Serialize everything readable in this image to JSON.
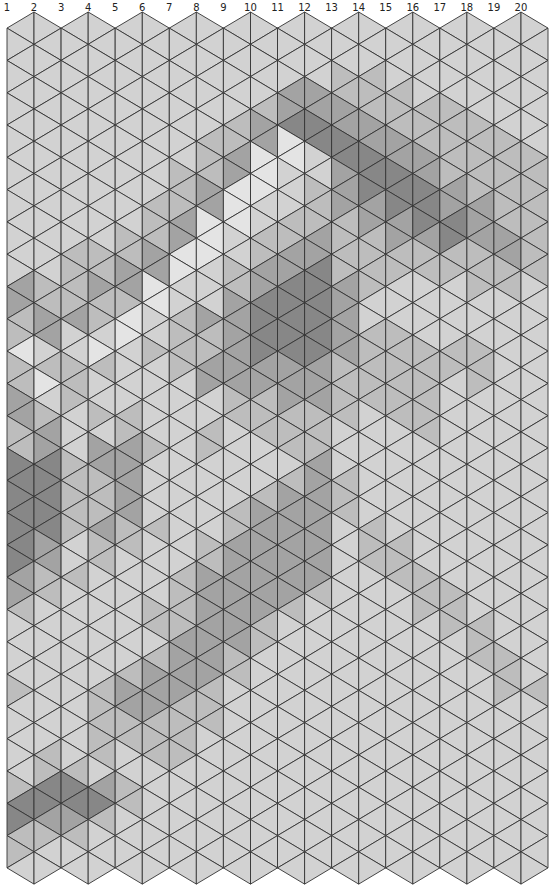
{
  "column_labels": [
    "1",
    "2",
    "3",
    "4",
    "5",
    "6",
    "7",
    "8",
    "9",
    "10",
    "11",
    "12",
    "13",
    "14",
    "15",
    "16",
    "17",
    "18",
    "19",
    "20"
  ],
  "grid": {
    "x0": 7,
    "col_width": 27.05,
    "num_columns": 20,
    "top_low": 28,
    "top_high": 12,
    "row_period": 32.3,
    "triangles_per_strip": 53,
    "line_color": "#333333",
    "line_width": 0.9
  },
  "palette": {
    "0": "#e4e4e4",
    "1": "#d2d2d2",
    "2": "#bdbdbd",
    "3": "#a3a3a3",
    "4": "#878787"
  },
  "strips": [
    "11111111111111113322022332244444443321111211111244221",
    "11111111111111112233120123344444332211111111122443211",
    "11111111111111222231122211122222112111111111112443211",
    "11111111111111223221021121332223221111111222221342111",
    "11111111111112233200111122333332211111112332211221111",
    "11111111111222330011211111211112111122123332221111111",
    "11111111122233001122221111111111112222333322221111111",
    "11111112223300011132233112211111223333333222111111111",
    "11111122330001122333333221111122333333322111111111111",
    "11111233000112233444433222111233333332211111111111111",
    "11113340011122334444433322212333333321111111111111111",
    "11113344112223344444433322233333333211111111111111111",
    "11122334433322223333322221112221111111111111111111111",
    "11122233444332222112222211111112221111111111111111111",
    "11112223344433221112222221111111222111111111111111111",
    "11111222334443221111222222111111112221111111111111111",
    "11111222223344221111221111111111111222111111111111111",
    "11111122222333222111222111111111111112221111111111111",
    "11111112222223322111111111111111111111122211111111111",
    "11111111222222221111111111111111111111111211111111111"
  ],
  "shade_legend": {
    "0": "lightest",
    "1": "light",
    "2": "medium-light",
    "3": "medium",
    "4": "dark"
  }
}
